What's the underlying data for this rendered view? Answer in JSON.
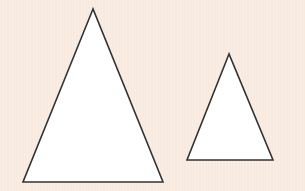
{
  "figure": {
    "background_color": "#f8eadf",
    "stroke_color": "#333333",
    "fill_color": "#ffffff",
    "shapes": [
      {
        "name": "large-triangle",
        "type": "triangle",
        "points": "93,9 23,182 163,182"
      },
      {
        "name": "small-triangle",
        "type": "triangle",
        "points": "229,54 187,160 273,160"
      }
    ]
  }
}
